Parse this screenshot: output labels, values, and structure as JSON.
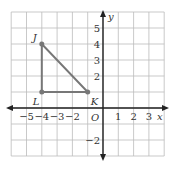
{
  "diagram": {
    "type": "coordinate-plane",
    "grid": {
      "x_min": -6,
      "x_max": 4,
      "y_min": -3,
      "y_max": 6,
      "color": "#bbbbbb"
    },
    "axes": {
      "x_label": "x",
      "y_label": "y",
      "origin_label": "O",
      "color": "#222222",
      "x_ticks": [
        {
          "value": -5,
          "label": "−5"
        },
        {
          "value": -4,
          "label": "−4"
        },
        {
          "value": -3,
          "label": "−3"
        },
        {
          "value": -2,
          "label": "−2"
        },
        {
          "value": 1,
          "label": "1"
        },
        {
          "value": 2,
          "label": "2"
        },
        {
          "value": 3,
          "label": "3"
        }
      ],
      "y_ticks": [
        {
          "value": 5,
          "label": "5"
        },
        {
          "value": 4,
          "label": "4"
        },
        {
          "value": 3,
          "label": "3"
        },
        {
          "value": 2,
          "label": "2"
        },
        {
          "value": -2,
          "label": "−2"
        }
      ]
    },
    "triangle": {
      "color": "#777777",
      "points": [
        {
          "name": "J",
          "x": -4,
          "y": 4
        },
        {
          "name": "L",
          "x": -4,
          "y": 1
        },
        {
          "name": "K",
          "x": -1,
          "y": 1
        }
      ]
    }
  }
}
